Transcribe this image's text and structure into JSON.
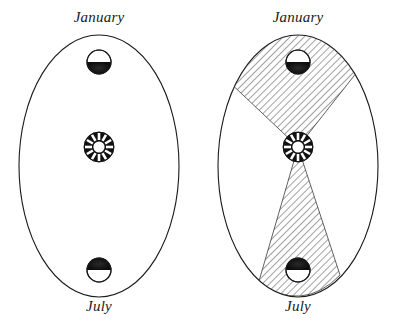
{
  "figure": {
    "background_color": "#ffffff",
    "line_color": "#1a1a1a",
    "hatch_color": "#555555",
    "sun_color": "#111111",
    "earth_dark_color": "#111111"
  },
  "panels": [
    {
      "id": "left",
      "name": "orbit-plain",
      "top_label": "January",
      "bottom_label": "July",
      "has_hatched_sectors": false,
      "orbit": {
        "shape": "ellipse",
        "center_x": 99,
        "center_y": 166,
        "radius_x": 80,
        "radius_y": 131
      },
      "sun": {
        "label": "sun-symbol",
        "center_x": 99,
        "center_y": 147,
        "outer_radius": 15,
        "inner_radius": 6,
        "spokes": 12
      },
      "bodies": [
        {
          "name": "earth-january",
          "month": "January",
          "center_x": 99,
          "center_y": 62,
          "radius": 12,
          "shaded_half": "bottom"
        },
        {
          "name": "earth-july",
          "month": "July",
          "center_x": 99,
          "center_y": 270,
          "radius": 12,
          "shaded_half": "top"
        }
      ]
    },
    {
      "id": "right",
      "name": "orbit-with-equal-area-sectors",
      "top_label": "January",
      "bottom_label": "July",
      "has_hatched_sectors": true,
      "orbit": {
        "shape": "ellipse",
        "center_x": 99,
        "center_y": 166,
        "radius_x": 80,
        "radius_y": 131
      },
      "sun": {
        "label": "sun-symbol",
        "center_x": 99,
        "center_y": 147,
        "outer_radius": 15,
        "inner_radius": 6,
        "spokes": 12
      },
      "bodies": [
        {
          "name": "earth-january",
          "month": "January",
          "center_x": 99,
          "center_y": 62,
          "radius": 12,
          "shaded_half": "bottom"
        },
        {
          "name": "earth-july",
          "month": "July",
          "center_x": 99,
          "center_y": 270,
          "radius": 12,
          "shaded_half": "top"
        }
      ],
      "sectors": [
        {
          "name": "sector-january",
          "description": "hatched wedge from Sun to January position",
          "apex_x": 99,
          "apex_y": 147,
          "left_x": 26,
          "left_y": 78,
          "right_x": 158,
          "right_y": 72,
          "hatch_angle_deg": 45
        },
        {
          "name": "sector-july",
          "description": "hatched wedge from Sun to July position",
          "apex_x": 99,
          "apex_y": 147,
          "left_x": 60,
          "left_y": 278,
          "right_x": 140,
          "right_y": 272,
          "hatch_angle_deg": 45
        }
      ]
    }
  ]
}
